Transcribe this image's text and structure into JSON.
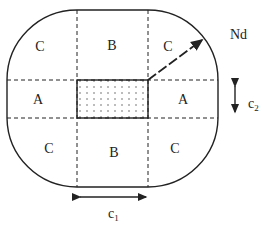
{
  "diagram": {
    "regions": {
      "top_left": "C",
      "top_center": "B",
      "top_right": "C",
      "middle_left": "A",
      "middle_right": "A",
      "bottom_left": "C",
      "bottom_center": "B",
      "bottom_right": "C"
    },
    "arrow_label": "Nd",
    "dimension_c1": {
      "base": "c",
      "sub": "1"
    },
    "dimension_c2": {
      "base": "c",
      "sub": "2"
    },
    "colors": {
      "stroke": "#222222",
      "background": "#ffffff"
    }
  }
}
